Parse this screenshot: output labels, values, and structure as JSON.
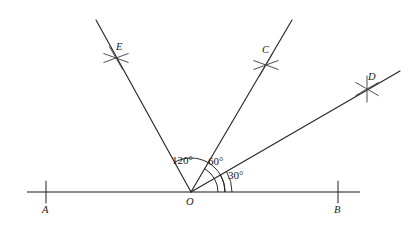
{
  "figure": {
    "kind": "geometry-construction-diagram",
    "background_color": "#ffffff",
    "line_color": "#1a1a1a",
    "canvas": {
      "width": 420,
      "height": 229
    }
  },
  "points": {
    "origin": {
      "label": "O",
      "x": 191,
      "y": 192,
      "label_x": 186,
      "label_y": 197
    },
    "a": {
      "label": "A",
      "x": 46,
      "y": 192,
      "label_x": 42,
      "label_y": 205
    },
    "b": {
      "label": "B",
      "x": 338,
      "y": 192,
      "label_x": 334,
      "label_y": 205
    },
    "c": {
      "label": "C",
      "x": 266,
      "y": 65,
      "label_x": 262,
      "label_y": 45
    },
    "d": {
      "label": "D",
      "x": 367,
      "y": 89,
      "label_x": 368,
      "label_y": 72
    },
    "e": {
      "label": "E",
      "x": 116,
      "y": 58,
      "label_x": 116,
      "label_y": 42
    }
  },
  "baseline": {
    "name": "line-AB",
    "x1": 27,
    "y1": 192,
    "x2": 360,
    "y2": 192
  },
  "rays": [
    {
      "name": "ray-OE",
      "to": "E",
      "angle_deg": 120,
      "x1": 191,
      "y1": 192,
      "x2": 96,
      "y2": 20
    },
    {
      "name": "ray-OC",
      "to": "C",
      "angle_deg": 60,
      "x1": 191,
      "y1": 192,
      "x2": 292,
      "y2": 20
    },
    {
      "name": "ray-OD",
      "to": "D",
      "angle_deg": 30,
      "x1": 191,
      "y1": 192,
      "x2": 400,
      "y2": 71
    }
  ],
  "angles": [
    {
      "name": "angle-120",
      "text": "120°",
      "value": 120,
      "label_x": 172,
      "label_y": 155,
      "arc_radius": 34,
      "from_deg": 0,
      "to_deg": 120
    },
    {
      "name": "angle-60",
      "text": "60°",
      "value": 60,
      "label_x": 208,
      "label_y": 156,
      "arc_radius": 27,
      "from_deg": 0,
      "to_deg": 60
    },
    {
      "name": "angle-30",
      "text": "30°",
      "value": 30,
      "label_x": 228,
      "label_y": 170,
      "arc_radius": 41,
      "from_deg": 0,
      "to_deg": 30
    }
  ],
  "tick_marks": [
    {
      "name": "tick-A",
      "x": 46,
      "y": 192,
      "half_len": 11
    },
    {
      "name": "tick-B",
      "x": 338,
      "y": 192,
      "half_len": 11
    }
  ],
  "construction_crosses": [
    {
      "name": "cross-E",
      "x": 116,
      "y": 58,
      "arm_len": 13,
      "angles_deg": [
        20,
        160,
        120
      ]
    },
    {
      "name": "cross-C",
      "x": 266,
      "y": 65,
      "arm_len": 13,
      "angles_deg": [
        20,
        160,
        60
      ]
    },
    {
      "name": "cross-D",
      "x": 367,
      "y": 89,
      "arm_len": 13,
      "angles_deg": [
        30,
        150,
        90
      ]
    }
  ]
}
